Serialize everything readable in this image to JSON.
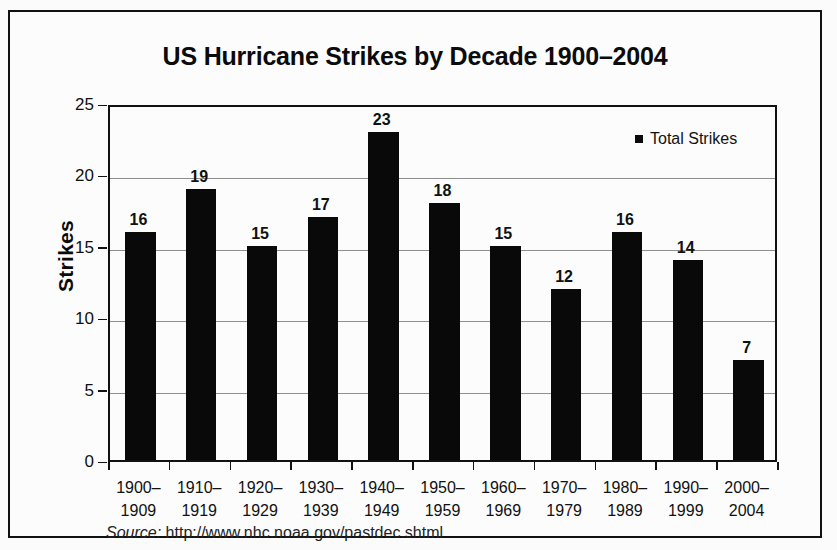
{
  "figure": {
    "title": "US Hurricane Strikes by Decade 1900–2004",
    "source_prefix": "Source:",
    "source_url": "http://www.nhc.noaa.gov/pastdec.shtml"
  },
  "legend": {
    "entries": [
      {
        "label": "Total Strikes",
        "color": "#0b0b0b",
        "marker": "square"
      }
    ],
    "position": "inside-top-right"
  },
  "colors": {
    "bar": "#090909",
    "gridline": "#8e8e8e",
    "axis": "#111111",
    "frame": "#111111",
    "background": "#fcfcfc"
  },
  "chart_data": {
    "type": "bar",
    "title": "US Hurricane Strikes by Decade 1900–2004",
    "xlabel": "",
    "ylabel": "Strikes",
    "ylim": [
      0,
      25
    ],
    "yticks": [
      0,
      5,
      10,
      15,
      20,
      25
    ],
    "grid": true,
    "legend_position": "inside-top-right",
    "categories": [
      "1900–1909",
      "1910–1919",
      "1920–1929",
      "1930–1939",
      "1940–1949",
      "1950–1959",
      "1960–1969",
      "1970–1979",
      "1980–1989",
      "1990–1999",
      "2000–2004"
    ],
    "category_lines": [
      [
        "1900–",
        "1909"
      ],
      [
        "1910–",
        "1919"
      ],
      [
        "1920–",
        "1929"
      ],
      [
        "1930–",
        "1939"
      ],
      [
        "1940–",
        "1949"
      ],
      [
        "1950–",
        "1959"
      ],
      [
        "1960–",
        "1969"
      ],
      [
        "1970–",
        "1979"
      ],
      [
        "1980–",
        "1989"
      ],
      [
        "1990–",
        "1999"
      ],
      [
        "2000–",
        "2004"
      ]
    ],
    "series": [
      {
        "name": "Total Strikes",
        "values": [
          16,
          19,
          15,
          17,
          23,
          18,
          15,
          12,
          16,
          14,
          7
        ]
      }
    ],
    "data_labels": [
      16,
      19,
      15,
      17,
      23,
      18,
      15,
      12,
      16,
      14,
      7
    ]
  }
}
